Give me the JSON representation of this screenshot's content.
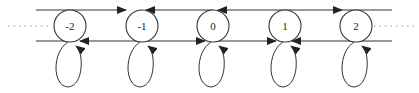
{
  "diagram": {
    "type": "markov-chain",
    "nodes": [
      {
        "id": "n-2",
        "label": "-2",
        "cx": 70,
        "cy": 26
      },
      {
        "id": "n-1",
        "label": "-1",
        "cx": 142,
        "cy": 26
      },
      {
        "id": "n0",
        "label": "0",
        "cx": 213,
        "cy": 26
      },
      {
        "id": "n1",
        "label": "1",
        "cx": 285,
        "cy": 26
      },
      {
        "id": "n2",
        "label": "2",
        "cx": 356,
        "cy": 26
      }
    ],
    "radius": 16,
    "continuation_left": "......",
    "continuation_right": "......",
    "colors": {
      "stroke": "#333333",
      "dotted": "#999999",
      "background": "#ffffff"
    }
  }
}
